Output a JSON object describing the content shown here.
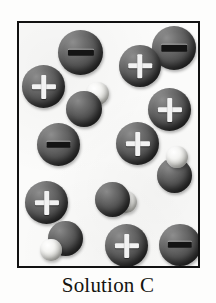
{
  "figure": {
    "caption": "Solution C",
    "container": {
      "name": "solution-container-box",
      "border_color": "#111111",
      "fill_color": "#fbfbfa",
      "x": 17,
      "y": 21,
      "width": 183,
      "height": 247
    },
    "background_color": "#ffffff",
    "legend_note": ""
  },
  "counts": {
    "positive_ions": 6,
    "negative_ions": 5,
    "molecules": 4,
    "negative_molecules": 2,
    "neutral_molecules": 2,
    "total_particles": 15
  },
  "colors": {
    "ion_dark": "#4a4a4a",
    "ion_highlight": "#8e8e8e",
    "hydrogen_light": "#f4f4f2",
    "charge_plus": "#f2f2f2",
    "charge_minus": "#141414",
    "caption_text": "#14140f"
  },
  "particles": [
    {
      "id": "ion-neg-1",
      "type": "ion",
      "charge": "-",
      "label": "negative-ion",
      "x": 56,
      "y": 28,
      "size": 45
    },
    {
      "id": "ion-neg-2",
      "type": "ion",
      "charge": "-",
      "label": "negative-ion",
      "x": 150,
      "y": 24,
      "size": 44
    },
    {
      "id": "ion-pos-1",
      "type": "ion",
      "charge": "+",
      "label": "positive-ion",
      "x": 117,
      "y": 43,
      "size": 42
    },
    {
      "id": "ion-pos-2",
      "type": "ion",
      "charge": "+",
      "label": "positive-ion",
      "x": 20,
      "y": 63,
      "size": 43
    },
    {
      "id": "mol-neg-1",
      "type": "molecule",
      "charge": "-",
      "label": "negative-molecule",
      "x": 64,
      "y": 80,
      "size": 45,
      "h_position": "upper-right"
    },
    {
      "id": "ion-pos-3",
      "type": "ion",
      "charge": "+",
      "label": "positive-ion",
      "x": 146,
      "y": 86,
      "size": 43
    },
    {
      "id": "ion-neg-3",
      "type": "ion",
      "charge": "-",
      "label": "negative-ion",
      "x": 35,
      "y": 121,
      "size": 43
    },
    {
      "id": "ion-pos-4",
      "type": "ion",
      "charge": "+",
      "label": "positive-ion",
      "x": 114,
      "y": 120,
      "size": 43
    },
    {
      "id": "mol-neu-1",
      "type": "molecule",
      "charge": "",
      "label": "neutral-molecule",
      "x": 155,
      "y": 144,
      "size": 44,
      "h_position": "top"
    },
    {
      "id": "ion-pos-5",
      "type": "ion",
      "charge": "+",
      "label": "positive-ion",
      "x": 23,
      "y": 179,
      "size": 43
    },
    {
      "id": "mol-neg-2",
      "type": "molecule",
      "charge": "-",
      "label": "negative-molecule",
      "x": 93,
      "y": 176,
      "size": 44,
      "h_position": "right"
    },
    {
      "id": "mol-neu-2",
      "type": "molecule",
      "charge": "",
      "label": "neutral-molecule",
      "x": 38,
      "y": 219,
      "size": 44,
      "h_position": "lower-left"
    },
    {
      "id": "ion-pos-6",
      "type": "ion",
      "charge": "+",
      "label": "positive-ion",
      "x": 103,
      "y": 222,
      "size": 43
    },
    {
      "id": "ion-neg-4",
      "type": "ion",
      "charge": "-",
      "label": "negative-ion",
      "x": 157,
      "y": 222,
      "size": 42
    }
  ]
}
